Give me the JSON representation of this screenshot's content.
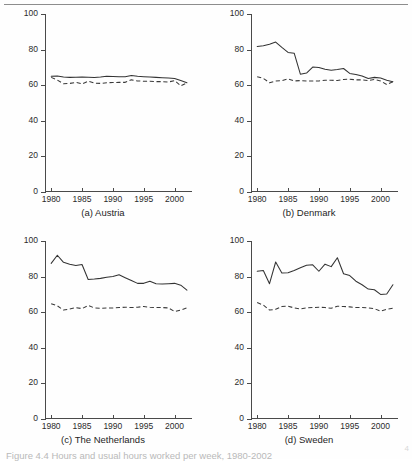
{
  "figure": {
    "caption": "Figure 4.4  Hours and usual hours worked per week, 1980-2002",
    "corner_mark": "4",
    "top_rule": true
  },
  "axes": {
    "y_ticks": [
      0,
      20,
      40,
      60,
      80,
      100
    ],
    "y_tick_labels": [
      "0",
      "20",
      "40",
      "60",
      "80",
      "100"
    ],
    "ylim": [
      0,
      100
    ],
    "x_ticks": [
      1980,
      1985,
      1990,
      1995,
      2000
    ],
    "x_tick_labels": [
      "1980",
      "1985",
      "1990",
      "1995",
      "2000"
    ],
    "xlim": [
      1979,
      2002.5
    ],
    "grid": false,
    "legend": "none"
  },
  "chart_data": [
    {
      "type": "line",
      "title": "(a) Austria",
      "panel": "a",
      "xlabel": "",
      "ylabel": "",
      "xlim": [
        1979,
        2002.5
      ],
      "ylim": [
        0,
        100
      ],
      "x": [
        1980,
        1981,
        1982,
        1983,
        1984,
        1985,
        1986,
        1987,
        1988,
        1989,
        1990,
        1991,
        1992,
        1993,
        1994,
        1995,
        1996,
        1997,
        1998,
        1999,
        2000,
        2001,
        2002
      ],
      "series": [
        {
          "name": "actual hours",
          "style": "solid",
          "values": [
            65.0,
            65.2,
            64.6,
            64.4,
            64.5,
            64.6,
            64.5,
            64.3,
            64.6,
            65.0,
            64.9,
            64.8,
            64.8,
            65.5,
            65.0,
            64.8,
            64.6,
            64.4,
            64.2,
            64.0,
            63.8,
            62.6,
            61.4
          ]
        },
        {
          "name": "usual hours",
          "style": "dashed",
          "values": [
            64.4,
            62.9,
            60.8,
            61.0,
            61.6,
            60.7,
            62.3,
            61.2,
            61.0,
            61.4,
            61.5,
            61.6,
            61.6,
            63.0,
            62.4,
            62.2,
            62.2,
            62.0,
            62.0,
            61.8,
            62.6,
            59.6,
            61.3
          ]
        }
      ]
    },
    {
      "type": "line",
      "title": "(b) Denmark",
      "panel": "b",
      "xlabel": "",
      "ylabel": "",
      "xlim": [
        1979,
        2002.5
      ],
      "ylim": [
        0,
        100
      ],
      "x": [
        1980,
        1981,
        1982,
        1983,
        1984,
        1985,
        1986,
        1987,
        1988,
        1989,
        1990,
        1991,
        1992,
        1993,
        1994,
        1995,
        1996,
        1997,
        1998,
        1999,
        2000,
        2001,
        2002
      ],
      "series": [
        {
          "name": "actual hours",
          "style": "solid",
          "values": [
            81.8,
            82.2,
            83.0,
            84.2,
            81.2,
            78.4,
            78.0,
            66.2,
            66.8,
            70.2,
            70.0,
            69.0,
            68.4,
            68.8,
            69.4,
            66.6,
            66.0,
            65.2,
            63.8,
            64.4,
            64.0,
            62.8,
            62.0
          ]
        },
        {
          "name": "usual hours",
          "style": "dashed",
          "values": [
            64.8,
            63.8,
            61.4,
            62.4,
            62.6,
            63.6,
            62.4,
            62.6,
            62.4,
            62.4,
            62.4,
            62.8,
            62.8,
            62.6,
            63.2,
            63.4,
            63.0,
            63.0,
            62.6,
            63.2,
            62.4,
            60.4,
            62.0
          ]
        }
      ]
    },
    {
      "type": "line",
      "title": "(c) The Netherlands",
      "panel": "c",
      "xlabel": "",
      "ylabel": "",
      "xlim": [
        1979,
        2002.5
      ],
      "ylim": [
        0,
        100
      ],
      "x": [
        1980,
        1981,
        1982,
        1983,
        1984,
        1985,
        1986,
        1987,
        1988,
        1989,
        1990,
        1991,
        1992,
        1993,
        1994,
        1995,
        1996,
        1997,
        1998,
        1999,
        2000,
        2001,
        2002
      ],
      "series": [
        {
          "name": "actual hours",
          "style": "solid",
          "values": [
            87.4,
            92.0,
            88.0,
            87.0,
            86.2,
            86.8,
            78.4,
            78.6,
            79.0,
            79.6,
            80.0,
            81.0,
            79.4,
            77.8,
            76.2,
            76.2,
            77.4,
            76.0,
            75.8,
            76.0,
            76.2,
            75.2,
            72.4
          ]
        },
        {
          "name": "usual hours",
          "style": "dashed",
          "values": [
            64.8,
            63.6,
            61.2,
            61.8,
            62.6,
            62.0,
            63.8,
            62.4,
            62.2,
            62.4,
            62.4,
            62.6,
            62.8,
            62.6,
            62.8,
            63.2,
            62.8,
            62.6,
            62.6,
            62.4,
            60.4,
            61.2,
            62.4
          ]
        }
      ]
    },
    {
      "type": "line",
      "title": "(d) Sweden",
      "panel": "d",
      "xlabel": "",
      "ylabel": "",
      "xlim": [
        1979,
        2002.5
      ],
      "ylim": [
        0,
        100
      ],
      "x": [
        1980,
        1981,
        1982,
        1983,
        1984,
        1985,
        1986,
        1987,
        1988,
        1989,
        1990,
        1991,
        1992,
        1993,
        1994,
        1995,
        1996,
        1997,
        1998,
        1999,
        2000,
        2001,
        2002
      ],
      "series": [
        {
          "name": "actual hours",
          "style": "solid",
          "values": [
            83.0,
            83.4,
            76.0,
            88.2,
            82.0,
            82.2,
            83.4,
            85.0,
            86.4,
            86.6,
            83.0,
            87.0,
            85.6,
            90.6,
            81.6,
            80.6,
            77.4,
            75.4,
            73.0,
            72.6,
            70.0,
            70.2,
            75.4
          ]
        },
        {
          "name": "usual hours",
          "style": "dashed",
          "values": [
            65.4,
            64.0,
            61.2,
            61.6,
            63.2,
            63.4,
            62.4,
            61.8,
            62.4,
            62.6,
            62.8,
            62.6,
            62.2,
            63.4,
            63.2,
            63.0,
            62.6,
            62.6,
            62.4,
            62.0,
            60.6,
            61.6,
            62.2
          ]
        }
      ]
    }
  ]
}
